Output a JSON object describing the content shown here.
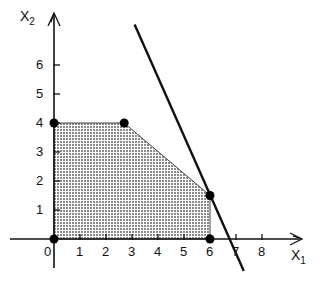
{
  "chart_data": {
    "type": "line",
    "title": "",
    "xlabel": "x1",
    "ylabel": "x2",
    "xlabel_main": "X",
    "xlabel_sub": "1",
    "ylabel_main": "X",
    "ylabel_sub": "2",
    "xlim": [
      -0.7,
      9.5
    ],
    "ylim": [
      -2.2,
      7.5
    ],
    "grid": false,
    "x_ticks": [
      0,
      1,
      2,
      3,
      4,
      5,
      6,
      7,
      8
    ],
    "x_tick_labels": [
      "0",
      "1",
      "2",
      "3",
      "4",
      "5",
      "6",
      "7",
      "8"
    ],
    "y_ticks": [
      1,
      2,
      3,
      4,
      5,
      6
    ],
    "y_tick_labels": [
      "1",
      "2",
      "3",
      "4",
      "5",
      "6"
    ],
    "feasible_region": {
      "fill": "dotted gray",
      "vertices": [
        [
          0,
          0
        ],
        [
          0,
          4
        ],
        [
          2.7,
          4
        ],
        [
          6,
          1.5
        ],
        [
          6,
          0
        ]
      ]
    },
    "vertex_points": [
      [
        0,
        0
      ],
      [
        0,
        4
      ],
      [
        2.7,
        4
      ],
      [
        6,
        1.5
      ],
      [
        6,
        0
      ]
    ],
    "series": [
      {
        "name": "objective/constraint line",
        "x": [
          3.1,
          7.3
        ],
        "y": [
          7.4,
          -1.1
        ]
      }
    ]
  },
  "colors": {
    "axis": "#111111",
    "line": "#111111",
    "region_fill": "#bdbdbd",
    "points": "#000000"
  }
}
